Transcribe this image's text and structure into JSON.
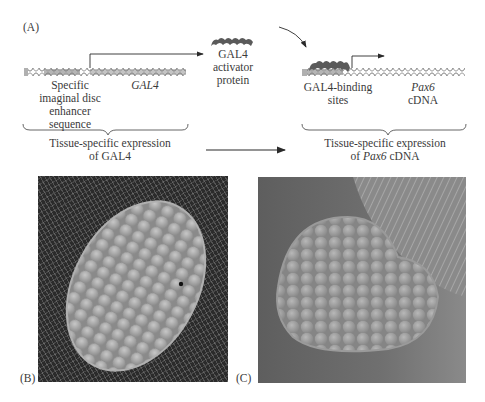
{
  "figure": {
    "panel_a": {
      "letter": "(A)",
      "left_construct": {
        "enhancer_label": [
          "Specific",
          "imaginal disc",
          "enhancer",
          "sequence"
        ],
        "gene_label": "GAL4",
        "caption_line1": "Tissue-specific expression",
        "caption_line2": "of GAL4"
      },
      "protein": {
        "label": [
          "GAL4",
          "activator",
          "protein"
        ]
      },
      "right_construct": {
        "binding_label": [
          "GAL4-binding",
          "sites"
        ],
        "gene_label_italic": "Pax6",
        "gene_label_suffix": "cDNA",
        "caption_line1": "Tissue-specific expression",
        "caption_line2_prefix": "of ",
        "caption_line2_italic": "Pax6",
        "caption_line2_suffix": " cDNA"
      }
    },
    "panel_b": {
      "letter": "(B)",
      "description": "Scanning electron micrograph of normal compound eye"
    },
    "panel_c": {
      "letter": "(C)",
      "description": "Scanning electron micrograph of ectopic eye induced by Pax6"
    },
    "colors": {
      "dna_strand": "#8a8a8a",
      "dna_fill": "#c8c8c8",
      "enhancer_fill": "#b5b5b5",
      "protein": "#5a5a5a",
      "arrow": "#2a2a2a",
      "photo_b_bg": "#2b2b2b",
      "photo_c_bg": "#6e6e6e",
      "eye_facet": "#a8a8a8"
    }
  }
}
